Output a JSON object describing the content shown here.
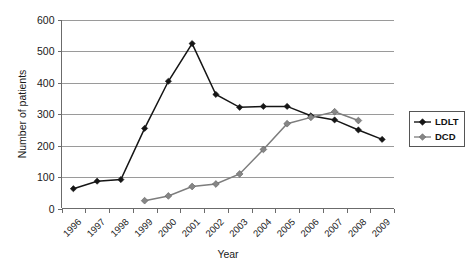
{
  "chart_data": {
    "type": "line",
    "title": "",
    "xlabel": "Year",
    "ylabel": "Number of patients",
    "categories": [
      "1996",
      "1997",
      "1998",
      "1999",
      "2000",
      "2001",
      "2002",
      "2003",
      "2004",
      "2005",
      "2006",
      "2007",
      "2008",
      "2009"
    ],
    "ylim": [
      0,
      600
    ],
    "yticks": [
      0,
      100,
      200,
      300,
      400,
      500,
      600
    ],
    "grid": "horizontal",
    "legend_position": "right",
    "series": [
      {
        "name": "LDLT",
        "color": "#151515",
        "marker": "diamond",
        "values": [
          63,
          87,
          92,
          255,
          405,
          525,
          363,
          322,
          325,
          325,
          295,
          282,
          250,
          220
        ]
      },
      {
        "name": "DCD",
        "color": "#868686",
        "marker": "diamond",
        "values": [
          null,
          null,
          null,
          25,
          40,
          70,
          78,
          110,
          188,
          270,
          290,
          308,
          280,
          null
        ]
      }
    ]
  },
  "legend": {
    "entries": [
      {
        "label": "LDLT"
      },
      {
        "label": "DCD"
      }
    ]
  },
  "axes": {
    "y_title": "Number of patients",
    "x_title": "Year"
  }
}
